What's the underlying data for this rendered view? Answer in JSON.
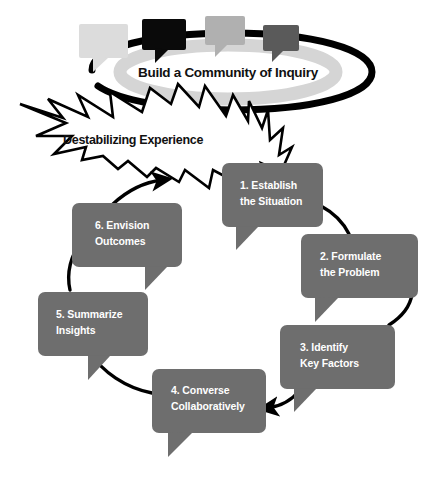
{
  "diagram": {
    "title_banner": {
      "label": "Build a Community of Inquiry",
      "ring_color": "#000000",
      "ring_inner_shadow_color": "#d5d5d5"
    },
    "speech_bubbles": [
      {
        "name": "bubble-light",
        "color": "#dcdcdc"
      },
      {
        "name": "bubble-black",
        "color": "#0a0a0a"
      },
      {
        "name": "bubble-medium",
        "color": "#b0b0b0"
      },
      {
        "name": "bubble-dark",
        "color": "#5a5a5a"
      }
    ],
    "burst": {
      "label": "Destabilizing Experience",
      "fill_color": "#ffffff",
      "stroke_color": "#000000"
    },
    "cycle": {
      "arrow_color": "#000000",
      "callout_fill": "#6e6e6e",
      "callout_text_color": "#ffffff",
      "steps": [
        {
          "id": "step-1",
          "line1": "1. Establish",
          "line2": "the Situation"
        },
        {
          "id": "step-2",
          "line1": "2. Formulate",
          "line2": "the Problem"
        },
        {
          "id": "step-3",
          "line1": "3. Identify",
          "line2": "Key Factors"
        },
        {
          "id": "step-4",
          "line1": "4. Converse",
          "line2": "Collaboratively"
        },
        {
          "id": "step-5",
          "line1": "5. Summarize",
          "line2": "Insights"
        },
        {
          "id": "step-6",
          "line1": "6. Envision",
          "line2": "Outcomes"
        }
      ]
    }
  }
}
